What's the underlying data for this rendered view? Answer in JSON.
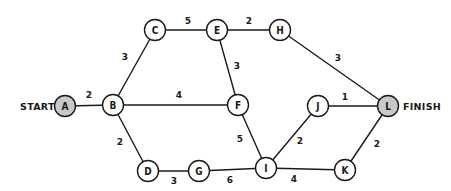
{
  "diagram": {
    "type": "weighted-network-graph",
    "start_label": "START",
    "finish_label": "FINISH",
    "colors": {
      "line": "#1a1a1a",
      "node_fill": "#ffffff",
      "terminal_fill": "#c8c8c8",
      "background": "#ffffff"
    },
    "nodes": [
      {
        "id": "A",
        "label": "A",
        "x": 65,
        "y": 106,
        "terminal": true
      },
      {
        "id": "B",
        "label": "B",
        "x": 113,
        "y": 105,
        "terminal": false
      },
      {
        "id": "C",
        "label": "C",
        "x": 155,
        "y": 30,
        "terminal": false
      },
      {
        "id": "E",
        "label": "E",
        "x": 217,
        "y": 30,
        "terminal": false
      },
      {
        "id": "H",
        "label": "H",
        "x": 280,
        "y": 30,
        "terminal": false
      },
      {
        "id": "F",
        "label": "F",
        "x": 238,
        "y": 105,
        "terminal": false
      },
      {
        "id": "J",
        "label": "J",
        "x": 318,
        "y": 106,
        "terminal": false
      },
      {
        "id": "L",
        "label": "L",
        "x": 388,
        "y": 106,
        "terminal": true
      },
      {
        "id": "D",
        "label": "D",
        "x": 148,
        "y": 171,
        "terminal": false
      },
      {
        "id": "G",
        "label": "G",
        "x": 199,
        "y": 171,
        "terminal": false
      },
      {
        "id": "I",
        "label": "I",
        "x": 266,
        "y": 168,
        "terminal": false
      },
      {
        "id": "K",
        "label": "K",
        "x": 345,
        "y": 170,
        "terminal": false
      }
    ],
    "edges": [
      {
        "from": "A",
        "to": "B",
        "weight": "2",
        "lx": 89,
        "ly": 95
      },
      {
        "from": "B",
        "to": "C",
        "weight": "3",
        "lx": 125,
        "ly": 57
      },
      {
        "from": "C",
        "to": "E",
        "weight": "5",
        "lx": 188,
        "ly": 21
      },
      {
        "from": "E",
        "to": "H",
        "weight": "2",
        "lx": 249,
        "ly": 21
      },
      {
        "from": "E",
        "to": "F",
        "weight": "3",
        "lx": 237,
        "ly": 66
      },
      {
        "from": "B",
        "to": "F",
        "weight": "4",
        "lx": 179,
        "ly": 95
      },
      {
        "from": "H",
        "to": "L",
        "weight": "3",
        "lx": 338,
        "ly": 58
      },
      {
        "from": "B",
        "to": "D",
        "weight": "2",
        "lx": 120,
        "ly": 142
      },
      {
        "from": "D",
        "to": "G",
        "weight": "3",
        "lx": 174,
        "ly": 181
      },
      {
        "from": "G",
        "to": "I",
        "weight": "6",
        "lx": 230,
        "ly": 180
      },
      {
        "from": "F",
        "to": "I",
        "weight": "5",
        "lx": 240,
        "ly": 139
      },
      {
        "from": "I",
        "to": "J",
        "weight": "2",
        "lx": 300,
        "ly": 141
      },
      {
        "from": "J",
        "to": "L",
        "weight": "1",
        "lx": 345,
        "ly": 97
      },
      {
        "from": "I",
        "to": "K",
        "weight": "4",
        "lx": 294,
        "ly": 179
      },
      {
        "from": "K",
        "to": "L",
        "weight": "2",
        "lx": 377,
        "ly": 144
      }
    ],
    "start_label_pos": {
      "x": 20,
      "y": 106
    },
    "finish_label_pos": {
      "x": 403,
      "y": 106
    }
  }
}
